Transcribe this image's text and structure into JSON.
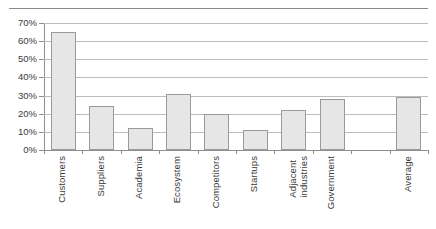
{
  "chart_data": {
    "type": "bar",
    "title": "",
    "subtitle": "",
    "xlabel": "",
    "ylabel": "",
    "categories": [
      "Customers",
      "Suppliers",
      "Academia",
      "Ecosystem",
      "Competitors",
      "Startups",
      "Adjacent\nindustries",
      "Government",
      "",
      "Average"
    ],
    "values": [
      65,
      24,
      12,
      31,
      20,
      11,
      22,
      28,
      null,
      29
    ],
    "value_labels": [
      "65%",
      "24%",
      "12%",
      "31%",
      "20%",
      "11%",
      "22%",
      "28%",
      "",
      "29%"
    ],
    "ylim": [
      0,
      70
    ],
    "ytick_values": [
      0,
      10,
      20,
      30,
      40,
      50,
      60,
      70
    ],
    "ytick_labels": [
      "0%",
      "10%",
      "20%",
      "30%",
      "40%",
      "50%",
      "60%",
      "70%"
    ],
    "grid": true,
    "grid_axis": "y",
    "legend": null,
    "legend_position": "none",
    "bar_fill_color": "#e6e6e6",
    "bar_border_color": "#9a9a9a",
    "gridline_color": "#bdbdbd",
    "axis_color": "#8f8f8f",
    "text_color": "#3b3b3b",
    "annotations": []
  },
  "decorations": {
    "top_rule": true
  }
}
